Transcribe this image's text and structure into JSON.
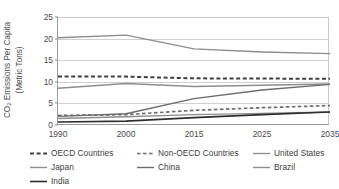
{
  "chart_data": {
    "type": "line",
    "title": "",
    "xlabel": "",
    "ylabel": "CO2 Emissions Per Capita (Metric Tons)",
    "ylabel_line1": "Emissions Per Capita",
    "ylabel_line2": "(Metric Tons)",
    "ylabel_prefix": "CO",
    "ylabel_subscript": "2",
    "x": [
      1990,
      2000,
      2015,
      2025,
      2035
    ],
    "xticklabels": [
      "1990",
      "2000",
      "2015",
      "2025",
      "2035"
    ],
    "yticks": [
      0,
      5,
      10,
      15,
      20,
      25
    ],
    "yticklabels": [
      "0",
      "5",
      "10",
      "15",
      "20",
      "25"
    ],
    "ylim": [
      0,
      25
    ],
    "grid": "horizontal",
    "legend_position": "below",
    "series": [
      {
        "name": "OECD Countries",
        "style": "dashed",
        "color": "#3f3f3f",
        "width": 2.0,
        "dash": "4,2.6",
        "values": [
          11.2,
          11.2,
          10.8,
          10.75,
          10.7
        ]
      },
      {
        "name": "Non-OECD Countries",
        "style": "dashed",
        "color": "#6e6e6e",
        "width": 1.7,
        "dash": "3.6,2.4",
        "values": [
          2.2,
          2.4,
          3.4,
          4.0,
          4.5
        ]
      },
      {
        "name": "United States",
        "style": "solid",
        "color": "#8d8d8d",
        "width": 1.3,
        "dash": "",
        "values": [
          20.2,
          20.8,
          17.6,
          16.9,
          16.5
        ]
      },
      {
        "name": "Japan",
        "style": "solid",
        "color": "#8d8d8d",
        "width": 1.4,
        "dash": "",
        "values": [
          8.5,
          9.6,
          8.9,
          9.2,
          9.5
        ]
      },
      {
        "name": "China",
        "style": "solid",
        "color": "#6b6b6b",
        "width": 1.4,
        "dash": "",
        "values": [
          2.0,
          2.6,
          6.1,
          8.1,
          9.4
        ]
      },
      {
        "name": "Brazil",
        "style": "solid",
        "color": "#8d8d8d",
        "width": 1.4,
        "dash": "",
        "values": [
          1.5,
          1.9,
          2.4,
          2.7,
          3.0
        ]
      },
      {
        "name": "India",
        "style": "solid",
        "color": "#2e2e2e",
        "width": 1.6,
        "dash": "",
        "values": [
          0.7,
          0.9,
          1.7,
          2.4,
          3.0
        ]
      }
    ]
  },
  "legend": {
    "rows": [
      [
        {
          "label": "OECD Countries",
          "series": 0
        },
        {
          "label": "Non-OECD Countries",
          "series": 1
        },
        {
          "label": "United States",
          "series": 2
        }
      ],
      [
        {
          "label": "Japan",
          "series": 3
        },
        {
          "label": "China",
          "series": 4
        },
        {
          "label": "Brazil",
          "series": 5
        }
      ],
      [
        {
          "label": "India",
          "series": 6
        }
      ]
    ]
  }
}
